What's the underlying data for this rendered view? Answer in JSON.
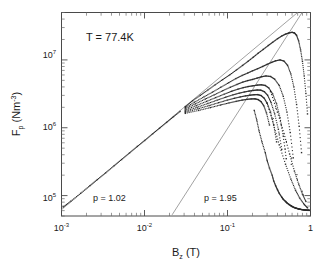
{
  "figure": {
    "annotation_temperature": "T = 77.4K",
    "annotation_p_low": "p = 1.02",
    "annotation_p_high": "p = 1.95",
    "axis_color": "#4a4a4a",
    "data_color": "#2b2b2b",
    "fit_color": "#8a8a8a"
  },
  "axes": {
    "x": {
      "title_main": "B",
      "title_sub": "z",
      "title_unit": " (T)",
      "ticklabels": [
        "10",
        "10",
        "10",
        "1"
      ],
      "tickexps": [
        "-3",
        "-2",
        "-1",
        ""
      ]
    },
    "y": {
      "title_main": "F",
      "title_sub": "p",
      "title_unit": " (Nm",
      "title_unit_exp": "-3",
      "title_unit_close": ")",
      "ticklabels": [
        "10",
        "10",
        "10"
      ],
      "tickexps": [
        "7",
        "6",
        "5"
      ]
    }
  },
  "chart_data": {
    "type": "scatter",
    "title": "",
    "xlabel": "B_z (T)",
    "ylabel": "F_p (Nm^-3)",
    "xscale": "log",
    "yscale": "log",
    "xlim": [
      0.001,
      1.0
    ],
    "ylim": [
      50000.0,
      50000000.0
    ],
    "xtick_values": [
      0.001,
      0.01,
      0.1,
      1
    ],
    "xtick_labels": [
      "10^-3",
      "10^-2",
      "10^-1",
      "1"
    ],
    "ytick_values": [
      100000.0,
      1000000.0,
      10000000.0
    ],
    "ytick_labels": [
      "10^5",
      "10^6",
      "10^7"
    ],
    "grid": false,
    "legend": null,
    "annotations": [
      {
        "text": "T = 77.4K",
        "x": 0.0035,
        "y": 20000000.0
      },
      {
        "text": "p = 1.02",
        "x": 0.0055,
        "y": 105000.0
      },
      {
        "text": "p = 1.95",
        "x": 0.11,
        "y": 105000.0
      }
    ],
    "reference_lines": [
      {
        "name": "p = 1.02 power law",
        "exponent": 1.02,
        "x": [
          0.001,
          1.0
        ],
        "y": [
          62000.0,
          72000000.0
        ]
      },
      {
        "name": "p = 1.95 power law",
        "exponent": 1.95,
        "x": [
          0.0215,
          1.0
        ],
        "y": [
          52000.0,
          78000000.0
        ]
      }
    ],
    "series": [
      {
        "name": "low-field common branch",
        "x": [
          0.00105,
          0.0013,
          0.0017,
          0.0022,
          0.0027,
          0.0034,
          0.0043,
          0.0053,
          0.0066,
          0.0082,
          0.0101,
          0.0125,
          0.0152,
          0.0185,
          0.0223,
          0.0268
        ],
        "y": [
          68000,
          83000,
          108000,
          140000,
          172000,
          216000,
          275000,
          340000,
          425000,
          530000,
          650000,
          810000,
          985000,
          1200000,
          1450000,
          1740000
        ]
      },
      {
        "name": "branch 1 (highest peak)",
        "x": [
          0.031,
          0.038,
          0.047,
          0.058,
          0.071,
          0.087,
          0.106,
          0.128,
          0.152,
          0.178,
          0.205,
          0.235,
          0.27,
          0.31,
          0.35,
          0.4,
          0.45,
          0.5,
          0.55,
          0.6,
          0.64,
          0.68,
          0.72,
          0.76,
          0.8,
          0.84,
          0.88,
          0.92
        ],
        "y": [
          2050000,
          2500000,
          3000000,
          3600000,
          4300000,
          5100000,
          6000000,
          7100000,
          8300000,
          9600000,
          11000000,
          12600000,
          14300000,
          16300000,
          18200000,
          20500000,
          22500000,
          24000000,
          25000000,
          25500000,
          25000000,
          23000000,
          19000000,
          14000000,
          9500000,
          5800000,
          3200000,
          1600000
        ]
      },
      {
        "name": "branch 2",
        "x": [
          0.031,
          0.04,
          0.052,
          0.066,
          0.083,
          0.103,
          0.126,
          0.15,
          0.175,
          0.2,
          0.23,
          0.265,
          0.3,
          0.34,
          0.38,
          0.43,
          0.48,
          0.53,
          0.58,
          0.63,
          0.68,
          0.73,
          0.78
        ],
        "y": [
          1980000,
          2380000,
          2850000,
          3350000,
          3950000,
          4600000,
          5300000,
          5900000,
          6400000,
          6900000,
          7400000,
          8000000,
          8600000,
          9200000,
          9700000,
          10000000,
          9600000,
          8300000,
          6200000,
          4000000,
          2200000,
          1050000,
          430000
        ]
      },
      {
        "name": "branch 3",
        "x": [
          0.031,
          0.041,
          0.054,
          0.069,
          0.087,
          0.108,
          0.13,
          0.152,
          0.175,
          0.2,
          0.228,
          0.258,
          0.29,
          0.33,
          0.37,
          0.42,
          0.47,
          0.52,
          0.57,
          0.62
        ],
        "y": [
          1900000,
          2250000,
          2650000,
          3050000,
          3500000,
          3950000,
          4350000,
          4700000,
          4950000,
          5150000,
          5400000,
          5650000,
          5800000,
          5700000,
          5200000,
          4200000,
          2900000,
          1700000,
          850000,
          360000
        ]
      },
      {
        "name": "branch 4",
        "x": [
          0.031,
          0.042,
          0.056,
          0.072,
          0.091,
          0.112,
          0.133,
          0.155,
          0.178,
          0.202,
          0.228,
          0.255,
          0.285,
          0.315,
          0.35,
          0.39,
          0.43,
          0.47,
          0.51
        ],
        "y": [
          1820000,
          2120000,
          2450000,
          2780000,
          3120000,
          3450000,
          3700000,
          3900000,
          4050000,
          4150000,
          4250000,
          4300000,
          4200000,
          3850000,
          3150000,
          2250000,
          1400000,
          750000,
          350000
        ]
      },
      {
        "name": "branch 5",
        "x": [
          0.031,
          0.043,
          0.058,
          0.075,
          0.095,
          0.116,
          0.138,
          0.16,
          0.182,
          0.205,
          0.228,
          0.252,
          0.278,
          0.305,
          0.335,
          0.37,
          0.41,
          0.45
        ],
        "y": [
          1750000,
          2000000,
          2280000,
          2550000,
          2820000,
          3050000,
          3230000,
          3370000,
          3470000,
          3550000,
          3600000,
          3580000,
          3400000,
          3000000,
          2350000,
          1600000,
          950000,
          480000
        ]
      },
      {
        "name": "branch 6",
        "x": [
          0.031,
          0.044,
          0.06,
          0.078,
          0.099,
          0.121,
          0.143,
          0.165,
          0.187,
          0.209,
          0.231,
          0.254,
          0.277,
          0.3,
          0.33,
          0.36,
          0.39
        ],
        "y": [
          1690000,
          1900000,
          2120000,
          2340000,
          2550000,
          2720000,
          2850000,
          2950000,
          3020000,
          3070000,
          3080000,
          2980000,
          2720000,
          2300000,
          1700000,
          1100000,
          620000
        ]
      },
      {
        "name": "branch 7 (lowest fan)",
        "x": [
          0.031,
          0.045,
          0.062,
          0.082,
          0.104,
          0.127,
          0.149,
          0.171,
          0.193,
          0.214,
          0.234,
          0.254,
          0.274,
          0.295,
          0.32
        ],
        "y": [
          1630000,
          1800000,
          1980000,
          2160000,
          2320000,
          2450000,
          2550000,
          2620000,
          2660000,
          2670000,
          2600000,
          2420000,
          2100000,
          1650000,
          1100000
        ]
      },
      {
        "name": "high-field scattered points",
        "x": [
          0.21,
          0.225,
          0.24,
          0.26,
          0.285,
          0.3,
          0.32,
          0.345,
          0.36,
          0.38,
          0.4,
          0.42,
          0.45,
          0.47,
          0.5,
          0.52,
          0.55,
          0.58,
          0.6,
          0.63,
          0.66,
          0.69,
          0.72,
          0.75,
          0.78,
          0.82,
          0.86,
          0.9,
          0.94,
          0.97,
          0.3,
          0.36,
          0.42,
          0.5,
          0.58,
          0.66,
          0.74,
          0.84,
          0.92,
          0.33,
          0.4,
          0.48,
          0.56,
          0.64,
          0.72,
          0.8,
          0.88
        ],
        "y": [
          1800000,
          1300000,
          900000,
          620000,
          430000,
          330000,
          255000,
          200000,
          165000,
          140000,
          122000,
          108000,
          95000,
          88000,
          82000,
          78000,
          74000,
          71000,
          69000,
          67000,
          65500,
          64500,
          63500,
          62800,
          62200,
          61600,
          61200,
          60900,
          60700,
          60600,
          2300000,
          1100000,
          560000,
          290000,
          175000,
          120000,
          92000,
          74000,
          66000,
          3400000,
          1700000,
          820000,
          410000,
          230000,
          148000,
          105000,
          82000
        ]
      }
    ]
  }
}
